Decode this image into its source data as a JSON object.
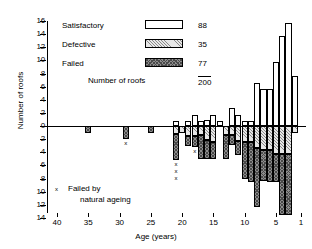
{
  "chart_data": {
    "type": "bar",
    "title": "",
    "xlabel": "Age (years)",
    "ylabel": "Number of roofs",
    "xlim": [
      40,
      1
    ],
    "ylim": [
      -14,
      16
    ],
    "grid": false,
    "orientation": "diverging-stacked",
    "axis_note": "Positive axis counts Satisfactory roofs; negative axis stacks Defective then Failed roofs.",
    "y_ticks_positive": [
      0,
      2,
      4,
      6,
      8,
      10,
      12,
      16
    ],
    "y_ticks_all": [
      16,
      14,
      12,
      10,
      8,
      6,
      4,
      2,
      0,
      2,
      4,
      6,
      8,
      10,
      12,
      14
    ],
    "x_ticks": [
      40,
      35,
      30,
      25,
      20,
      15,
      10,
      5,
      1
    ],
    "legend_position": "top-left",
    "series": [
      {
        "name": "Satisfactory",
        "count": 88,
        "fill": "white",
        "direction": "up"
      },
      {
        "name": "Defective",
        "count": 35,
        "fill": "light-hatch",
        "direction": "down"
      },
      {
        "name": "Failed",
        "count": 77,
        "fill": "dark-checker",
        "direction": "down"
      }
    ],
    "total_label": "Number of roofs",
    "total_value": 200,
    "ages": [
      35,
      29,
      25,
      21,
      20,
      19,
      18,
      17,
      16,
      15,
      14,
      13,
      12,
      11,
      10,
      9,
      8,
      7,
      6,
      5,
      4,
      3,
      2
    ],
    "satisfactory": [
      0,
      0,
      0,
      0.8,
      0,
      0.7,
      1.7,
      0.8,
      0.9,
      1.7,
      0.7,
      0,
      2.7,
      1.7,
      0.7,
      0.8,
      6.6,
      5.6,
      5.6,
      9.7,
      13.7,
      15.7,
      7.6
    ],
    "defective": [
      0,
      0,
      0,
      1.2,
      1,
      1.5,
      1.5,
      1.4,
      2.2,
      2.5,
      0,
      1.4,
      1.4,
      2.3,
      2.4,
      2.5,
      3.3,
      3.6,
      3.6,
      4.3,
      4.3,
      4.3,
      1
    ],
    "failed": [
      1,
      2,
      1,
      4.0,
      0,
      1.5,
      1.7,
      3.6,
      2.9,
      2.5,
      0,
      3.6,
      1.5,
      2.1,
      5.6,
      6.0,
      9.1,
      4.8,
      5.0,
      4.2,
      9.2,
      9.2,
      0
    ],
    "natural_ageing_marks": [
      {
        "age": 29,
        "count": 1
      },
      {
        "age": 21,
        "count": 3
      },
      {
        "age": 18,
        "count": 1
      }
    ],
    "annotation": {
      "marker": "x",
      "line1": "Failed by",
      "line2": "natural ageing"
    }
  },
  "axes": {
    "y_title": "Number of roofs",
    "x_title": "Age (years)",
    "y_labels": [
      "16",
      "14",
      "12",
      "10",
      "8",
      "6",
      "4",
      "2",
      "0",
      "2",
      "4",
      "6",
      "8",
      "10",
      "12",
      "14"
    ],
    "x_labels": [
      "40",
      "35",
      "30",
      "25",
      "20",
      "15",
      "10",
      "5",
      "1"
    ]
  },
  "legend": {
    "rows": [
      {
        "label": "Satisfactory",
        "value": "88",
        "swatch": "satisfactory-swatch"
      },
      {
        "label": "Defective",
        "value": "35",
        "swatch": "defective-swatch"
      },
      {
        "label": "Failed",
        "value": "77",
        "swatch": "failed-swatch"
      }
    ],
    "total_label": "Number of roofs",
    "total_value": "200"
  },
  "note": {
    "marker": "x",
    "line1": "Failed by",
    "line2": "natural ageing"
  }
}
